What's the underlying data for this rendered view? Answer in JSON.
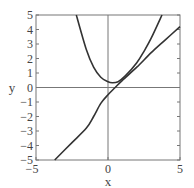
{
  "chart_data": {
    "type": "line",
    "title": "",
    "xlabel": "x",
    "ylabel": "y",
    "xlim": [
      -5,
      5
    ],
    "ylim": [
      -5,
      5
    ],
    "grid": false,
    "x_ticks": [
      "-5",
      "0",
      "5"
    ],
    "y_ticks": [
      "5",
      "4",
      "3",
      "2",
      "1",
      "0",
      "-1",
      "-2",
      "-3",
      "-4",
      "-5"
    ],
    "series": [
      {
        "name": "parabola",
        "color": "#333333",
        "points": [
          [
            -2.2,
            5
          ],
          [
            -1.5,
            2.6
          ],
          [
            -1,
            1.4
          ],
          [
            -0.5,
            0.7
          ],
          [
            0,
            0.4
          ],
          [
            0.3,
            0.33
          ],
          [
            0.7,
            0.4
          ],
          [
            1.2,
            0.8
          ],
          [
            2,
            1.7
          ],
          [
            2.5,
            2.5
          ],
          [
            3,
            3.4
          ],
          [
            3.75,
            5
          ]
        ]
      },
      {
        "name": "line",
        "color": "#333333",
        "points": [
          [
            -3.7,
            -5
          ],
          [
            -2.5,
            -3.8
          ],
          [
            -1.5,
            -2.8
          ],
          [
            -1,
            -2
          ],
          [
            -0.5,
            -1.1
          ],
          [
            0,
            -0.5
          ],
          [
            0.5,
            0
          ],
          [
            1,
            0.5
          ],
          [
            2,
            1.4
          ],
          [
            3,
            2.4
          ],
          [
            4,
            3.3
          ],
          [
            5,
            4.2
          ]
        ]
      }
    ]
  }
}
